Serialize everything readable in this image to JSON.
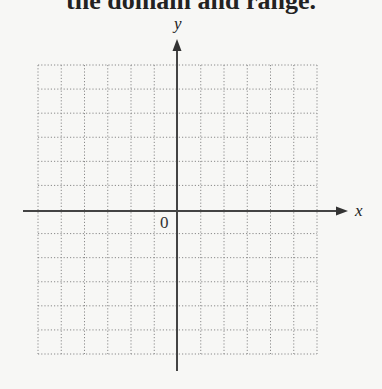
{
  "header": {
    "text": "the domain and range."
  },
  "graph": {
    "x_label": "x",
    "y_label": "y",
    "origin_label": "0",
    "grid_columns": 12,
    "grid_rows": 12,
    "grid_style": "dotted",
    "axis_color": "#444444",
    "grid_color": "#888888"
  }
}
